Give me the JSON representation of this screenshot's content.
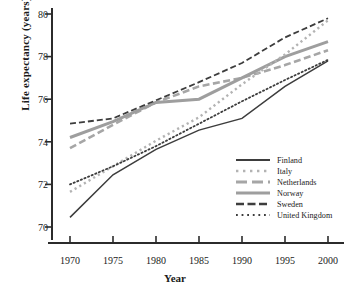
{
  "chart_data": {
    "type": "line",
    "title": "",
    "xlabel": "Year",
    "ylabel": "Life expectancy (years)",
    "xlim": [
      1968,
      2002
    ],
    "ylim": [
      69.3,
      80.4
    ],
    "xticks": [
      1970,
      1975,
      1980,
      1985,
      1990,
      1995,
      2000
    ],
    "yticks": [
      70,
      72,
      74,
      76,
      78,
      80
    ],
    "grid": false,
    "legend_position": "lower-right-inside",
    "x": [
      1970,
      1975,
      1980,
      1985,
      1990,
      1995,
      2000
    ],
    "series": [
      {
        "name": "Finland",
        "values": [
          70.45,
          72.45,
          73.65,
          74.55,
          75.1,
          76.6,
          77.8
        ],
        "color": "#3d3d3d",
        "style": "solid",
        "width": 1.5
      },
      {
        "name": "Italy",
        "values": [
          71.65,
          72.85,
          74.05,
          75.15,
          76.7,
          78.1,
          79.7
        ],
        "color": "#b3b3b3",
        "style": "dotted-square",
        "width": 2.4
      },
      {
        "name": "Netherlands",
        "values": [
          73.7,
          74.8,
          75.85,
          76.6,
          77.0,
          77.6,
          78.3
        ],
        "color": "#a6a6a6",
        "style": "dashed",
        "width": 2.6
      },
      {
        "name": "Norway",
        "values": [
          74.2,
          74.95,
          75.85,
          76.0,
          77.0,
          78.0,
          78.7
        ],
        "color": "#9e9e9e",
        "style": "solid",
        "width": 3.0
      },
      {
        "name": "Sweden",
        "values": [
          74.85,
          75.1,
          75.95,
          76.8,
          77.7,
          78.9,
          79.8
        ],
        "color": "#3d3d3d",
        "style": "dashed",
        "width": 1.8
      },
      {
        "name": "United Kingdom",
        "values": [
          72.0,
          72.85,
          73.8,
          74.85,
          75.9,
          76.9,
          77.85
        ],
        "color": "#3d3d3d",
        "style": "dotted",
        "width": 1.8
      }
    ]
  },
  "legend": {
    "entries": [
      {
        "label": "Finland"
      },
      {
        "label": "Italy"
      },
      {
        "label": "Netherlands"
      },
      {
        "label": "Norway"
      },
      {
        "label": "Sweden"
      },
      {
        "label": "United Kingdom"
      }
    ]
  },
  "axis": {
    "y_tick_labels": [
      "80",
      "78",
      "76",
      "74",
      "72",
      "70"
    ],
    "x_tick_labels": [
      "1970",
      "1975",
      "1980",
      "1985",
      "1990",
      "1995",
      "2000"
    ]
  }
}
